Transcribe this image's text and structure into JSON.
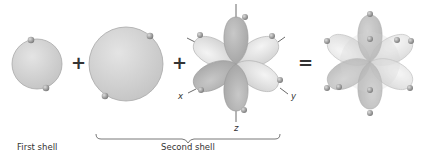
{
  "labels": {
    "first_shell": "First shell",
    "second_shell": "Second shell"
  },
  "operators": {
    "plus1": "+",
    "plus2": "+",
    "equals": "="
  },
  "axes": {
    "x": "x",
    "y": "y",
    "z": "z"
  },
  "colors": {
    "sphere_fill": "#d2d2d2",
    "sphere_edge": "#a8a8a8",
    "lobe_dark": "#b5b5b5",
    "lobe_light": "#e6e6e6",
    "electron": "#9a9a9a",
    "text": "#333333"
  }
}
